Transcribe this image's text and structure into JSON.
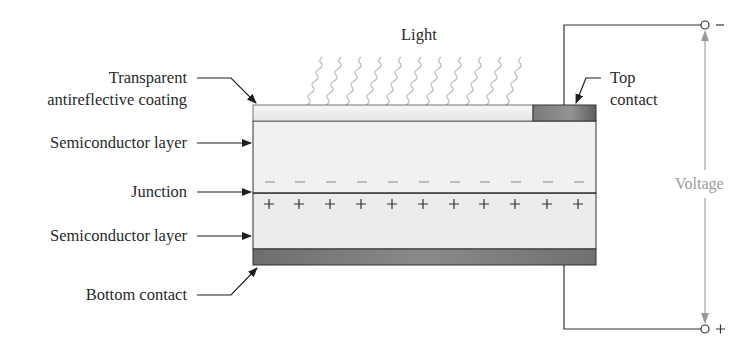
{
  "diagram": {
    "title_label": "Light",
    "labels": {
      "coating_line1": "Transparent",
      "coating_line2": "antireflective coating",
      "top_semiconductor": "Semiconductor layer",
      "junction": "Junction",
      "bottom_semiconductor": "Semiconductor layer",
      "bottom_contact": "Bottom contact",
      "top_contact_line1": "Top",
      "top_contact_line2": "contact",
      "voltage": "Voltage"
    },
    "terminals": {
      "top_sign": "–",
      "bottom_sign": "+"
    },
    "charges": {
      "negative_symbol": "–",
      "positive_symbol": "+",
      "count": 11
    },
    "colors": {
      "line": "#2a2a2a",
      "coating": "#eeeeee",
      "semiconductor": "#efefef",
      "contact": "#7d7d7d",
      "voltage_gray": "#9a9a9a",
      "light_wave": "#b5b5b5"
    }
  }
}
